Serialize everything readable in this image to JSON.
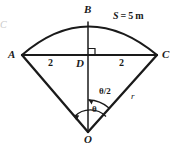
{
  "figure": {
    "type": "geometry-diagram",
    "stroke_color": "#1a1a1a",
    "background_color": "#ffffff",
    "points": {
      "A": "A",
      "B": "B",
      "C": "C",
      "D": "D",
      "O": "O"
    },
    "segment_labels": {
      "left_half": "2",
      "right_half": "2"
    },
    "angle_labels": {
      "half_angle": "θ/2",
      "full_angle": "θ"
    },
    "radius_label": "r",
    "arc_label": {
      "symbol": "S",
      "equals": "=",
      "value": "5",
      "unit": "m",
      "full": "S = 5 m"
    },
    "right_angle_at": "D",
    "edge_artifact": "C"
  }
}
